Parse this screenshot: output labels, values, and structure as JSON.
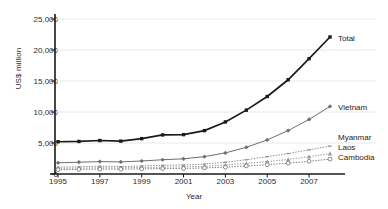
{
  "chart_data": {
    "type": "line",
    "title": "",
    "xlabel": "Year",
    "ylabel": "US$ million",
    "x": [
      1995,
      1996,
      1997,
      1998,
      1999,
      2000,
      2001,
      2002,
      2003,
      2004,
      2005,
      2006,
      2007,
      2008
    ],
    "xlim": [
      1995,
      2008
    ],
    "ylim": [
      0,
      25000
    ],
    "yticks": [
      0,
      5000,
      10000,
      15000,
      20000,
      25000
    ],
    "ytick_labels": [
      "0",
      "5,000",
      "10,000",
      "15,000",
      "20,000",
      "25,000"
    ],
    "xticks": [
      1995,
      1997,
      1999,
      2001,
      2003,
      2005,
      2007
    ],
    "xtick_labels": [
      "1995",
      "1997",
      "1999",
      "2001",
      "2003",
      "2005",
      "2007"
    ],
    "grid": "horizontal",
    "legend_position": "right-inline",
    "series": [
      {
        "name": "Total",
        "color": "#1a1a1a",
        "marker": "filled-square",
        "line_style": "solid",
        "values": [
          5200,
          5250,
          5400,
          5300,
          5700,
          6300,
          6350,
          7000,
          8400,
          10300,
          12500,
          15200,
          18600,
          22100
        ]
      },
      {
        "name": "Vietnam",
        "color": "#6e6e6e",
        "marker": "filled-diamond",
        "line_style": "solid",
        "values": [
          1800,
          1900,
          2000,
          1950,
          2100,
          2300,
          2450,
          2800,
          3400,
          4300,
          5500,
          7000,
          8800,
          10900
        ]
      },
      {
        "name": "Myanmar",
        "color": "#8a8a8a",
        "marker": "small-dash",
        "line_style": "dotted",
        "values": [
          1100,
          1150,
          1250,
          1200,
          1300,
          1400,
          1450,
          1600,
          1900,
          2300,
          2800,
          3300,
          3900,
          4500
        ]
      },
      {
        "name": "Laos",
        "color": "#9a9a9a",
        "marker": "filled-triangle",
        "line_style": "dotted",
        "values": [
          900,
          950,
          1000,
          980,
          1050,
          1100,
          1150,
          1250,
          1450,
          1700,
          2000,
          2350,
          2800,
          3300
        ]
      },
      {
        "name": "Cambodia",
        "color": "#7a7a7a",
        "marker": "open-circle",
        "line_style": "dotted",
        "values": [
          700,
          750,
          800,
          780,
          820,
          880,
          900,
          980,
          1100,
          1300,
          1500,
          1750,
          2050,
          2400
        ]
      }
    ]
  },
  "colors": {
    "background": "#ffffff",
    "axis": "#1a1a1a",
    "grid": "#e8e8e8",
    "text": "#2b2b2b"
  }
}
